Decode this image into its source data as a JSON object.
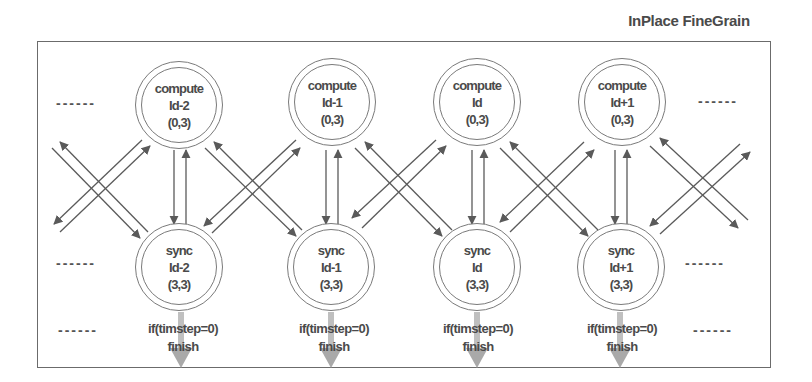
{
  "title": "InPlace FineGrain",
  "colors": {
    "stroke": "#5a5a5a",
    "finish_arrow": "#a9a9a9",
    "text": "#4a4a4a"
  },
  "ellipsis": "------",
  "compute_nodes": [
    {
      "kind": "compute",
      "id": "Id-2",
      "coord": "(0,3)"
    },
    {
      "kind": "compute",
      "id": "Id-1",
      "coord": "(0,3)"
    },
    {
      "kind": "compute",
      "id": "Id",
      "coord": "(0,3)"
    },
    {
      "kind": "compute",
      "id": "Id+1",
      "coord": "(0,3)"
    }
  ],
  "sync_nodes": [
    {
      "kind": "sync",
      "id": "Id-2",
      "coord": "(3,3)"
    },
    {
      "kind": "sync",
      "id": "Id-1",
      "coord": "(3,3)"
    },
    {
      "kind": "sync",
      "id": "Id",
      "coord": "(3,3)"
    },
    {
      "kind": "sync",
      "id": "Id+1",
      "coord": "(3,3)"
    }
  ],
  "finish_conditions": [
    {
      "condition": "if(timstep=0)",
      "action": "finish"
    },
    {
      "condition": "if(timstep=0)",
      "action": "finish"
    },
    {
      "condition": "if(timstep=0)",
      "action": "finish"
    },
    {
      "condition": "if(timstep=0)",
      "action": "finish"
    }
  ]
}
